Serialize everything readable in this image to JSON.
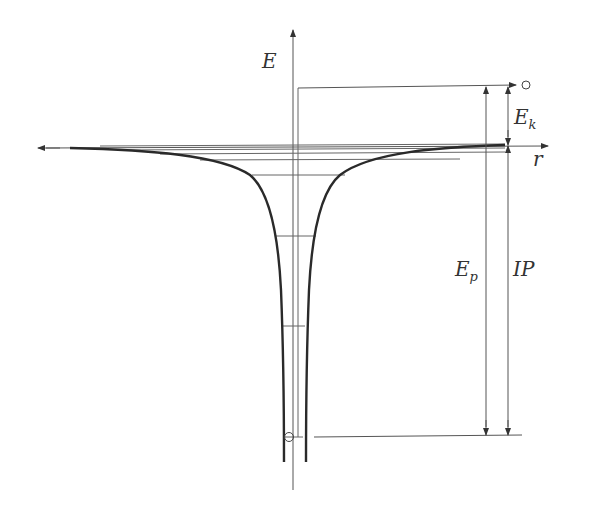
{
  "diagram": {
    "labels": {
      "energy_axis": "E",
      "radius_axis": "r",
      "kinetic": "E",
      "kinetic_sub": "k",
      "potential": "E",
      "potential_sub": "p",
      "ionization": "IP"
    },
    "energy_levels_count": 7,
    "colors": {
      "curve": "#2a2a2a",
      "lines": "#555555",
      "background": "#ffffff"
    }
  }
}
